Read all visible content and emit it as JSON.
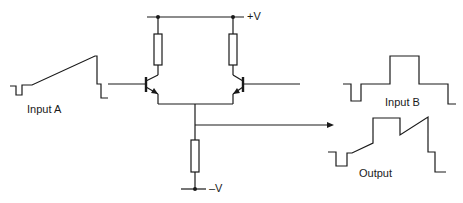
{
  "diagram": {
    "labels": {
      "positive_supply": "+V",
      "negative_supply": "–V",
      "input_a": "Input A",
      "input_b": "Input B",
      "output": "Output"
    },
    "components": [
      {
        "type": "resistor",
        "name": "left-collector-resistor"
      },
      {
        "type": "resistor",
        "name": "right-collector-resistor"
      },
      {
        "type": "resistor",
        "name": "tail-resistor"
      },
      {
        "type": "npn-transistor",
        "name": "left-transistor",
        "input": "Input A"
      },
      {
        "type": "npn-transistor",
        "name": "right-transistor",
        "input": "Input B"
      }
    ],
    "waveforms": {
      "input_a": "small negative pulse followed by rising ramp, then sharp step down",
      "input_b": "small negative pulse followed by a rectangular positive pulse, then step down",
      "output": "small negative pulse, ramp up, rectangular pulse, ramp, then steps down (sum of inputs)"
    },
    "colors": {
      "line": "#1a1a1a",
      "background": "#ffffff"
    }
  }
}
